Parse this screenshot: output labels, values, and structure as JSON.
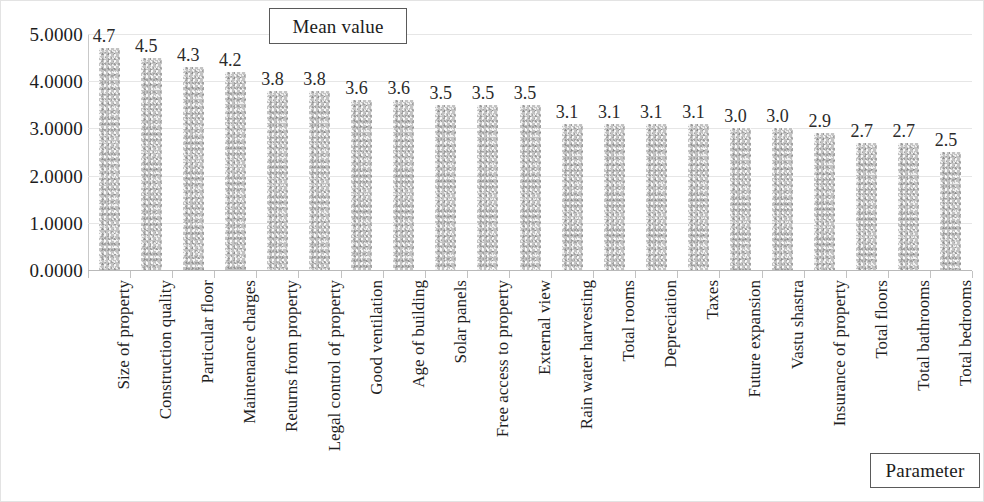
{
  "legend": {
    "series_label": "Mean value",
    "axis_title_label": "Parameter"
  },
  "axis": {
    "y_ticks": [
      "0.0000",
      "1.0000",
      "2.0000",
      "3.0000",
      "4.0000",
      "5.0000"
    ]
  },
  "chart_data": {
    "type": "bar",
    "title": "",
    "subtitle": "",
    "xlabel": "Parameter",
    "ylabel": "Mean value",
    "ylim": [
      0,
      5
    ],
    "ytick_values": [
      0,
      1,
      2,
      3,
      4,
      5
    ],
    "ytick_labels": [
      "0.0000",
      "1.0000",
      "2.0000",
      "3.0000",
      "4.0000",
      "5.0000"
    ],
    "grid": true,
    "legend_position": "top-center",
    "series": [
      {
        "name": "Mean value",
        "color": "#c3c3c3",
        "values": [
          4.7,
          4.5,
          4.3,
          4.2,
          3.8,
          3.8,
          3.6,
          3.6,
          3.5,
          3.5,
          3.5,
          3.1,
          3.1,
          3.1,
          3.1,
          3.0,
          3.0,
          2.9,
          2.7,
          2.7,
          2.5
        ]
      }
    ],
    "categories": [
      "Size of property",
      "Construction quality",
      "Particular floor",
      "Maintenance charges",
      "Returns from property",
      "Legal control of property",
      "Good ventilation",
      "Age of building",
      "Solar panels",
      "Free access to property",
      "External view",
      "Rain water harvesting",
      "Total rooms",
      "Depreciation",
      "Taxes",
      "Future expansion",
      "Vastu shastra",
      "Insurance of property",
      "Total floors",
      "Total bathrooms",
      "Total bedrooms"
    ],
    "data_labels": [
      "4.7",
      "4.5",
      "4.3",
      "4.2",
      "3.8",
      "3.8",
      "3.6",
      "3.6",
      "3.5",
      "3.5",
      "3.5",
      "3.1",
      "3.1",
      "3.1",
      "3.1",
      "3.0",
      "3.0",
      "2.9",
      "2.7",
      "2.7",
      "2.5"
    ]
  }
}
